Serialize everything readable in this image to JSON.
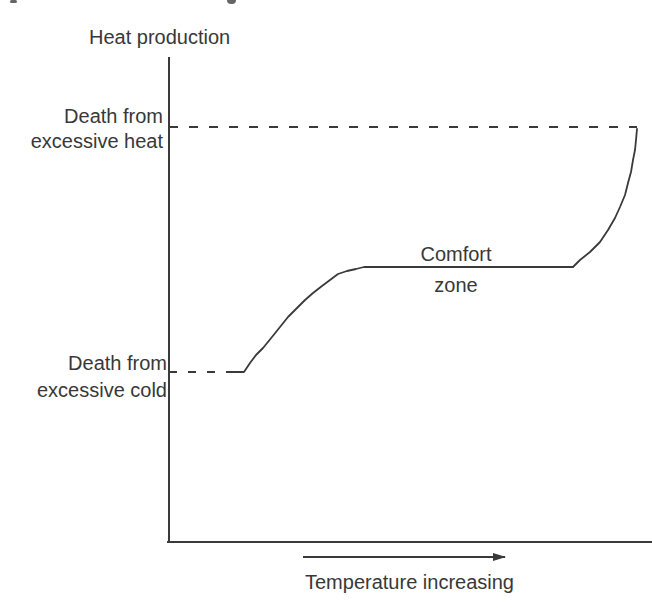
{
  "page": {
    "background": "#ffffff"
  },
  "colors": {
    "ink": "#3a3a3a",
    "text": "#383838"
  },
  "figure": {
    "y_axis_label": "Heat production",
    "x_axis_label": "Temperature increasing",
    "threshold_high_label": "Death from\nexcessive heat",
    "threshold_low_label": "Death from\nexcessive cold",
    "comfort_zone_label": "Comfort\nzone"
  },
  "chart_data": {
    "type": "line",
    "title": "",
    "xlabel": "Temperature increasing",
    "ylabel": "Heat production",
    "grid": false,
    "legend": false,
    "x_ticks": [],
    "y_ticks": [],
    "axis_note": "no numeric scales; x-axis direction shown by arrow labeled Temperature increasing",
    "annotations": [
      {
        "label": "Death from excessive heat",
        "style": "dashed horizontal threshold",
        "position": "upper, level with top of curve"
      },
      {
        "label": "Death from excessive cold",
        "style": "dashed horizontal threshold",
        "position": "lower, level with start of curve"
      },
      {
        "label": "Comfort zone",
        "style": "text centered above the flat plateau",
        "position": "middle"
      }
    ],
    "series": [
      {
        "name": "heat-production-curve",
        "shape": "starts high-slope rise from cold-death threshold, flattens into comfort-zone plateau, then steepens sharply upward to heat-death threshold",
        "points_px": [
          [
            228,
            372
          ],
          [
            244,
            372
          ],
          [
            250,
            363
          ],
          [
            256,
            355
          ],
          [
            263,
            348
          ],
          [
            272,
            337
          ],
          [
            280,
            327
          ],
          [
            288,
            317
          ],
          [
            297,
            308
          ],
          [
            305,
            300
          ],
          [
            313,
            293
          ],
          [
            322,
            286
          ],
          [
            330,
            280
          ],
          [
            338,
            274
          ],
          [
            347,
            271
          ],
          [
            356,
            269
          ],
          [
            364,
            267
          ],
          [
            573,
            267
          ],
          [
            580,
            260
          ],
          [
            590,
            252
          ],
          [
            600,
            242
          ],
          [
            608,
            230
          ],
          [
            615,
            218
          ],
          [
            620,
            207
          ],
          [
            625,
            195
          ],
          [
            628,
            183
          ],
          [
            631,
            172
          ],
          [
            633,
            160
          ],
          [
            635,
            150
          ],
          [
            636,
            140
          ],
          [
            637,
            129
          ]
        ]
      }
    ],
    "geometry": {
      "lines": [
        {
          "name": "y-axis",
          "x1": 169,
          "y1": 57,
          "x2": 169,
          "y2": 542,
          "dash": ""
        },
        {
          "name": "x-axis",
          "x1": 167,
          "y1": 542,
          "x2": 652,
          "y2": 542,
          "dash": ""
        },
        {
          "name": "heat-death-dashed-line",
          "x1": 169,
          "y1": 127,
          "x2": 637,
          "y2": 127,
          "dash": "9 11"
        },
        {
          "name": "cold-death-dashed-line",
          "x1": 169,
          "y1": 372,
          "x2": 229,
          "y2": 372,
          "dash": "8 11"
        },
        {
          "name": "temperature-arrow",
          "x1": 303,
          "y1": 557,
          "x2": 505,
          "y2": 557,
          "dash": "",
          "arrow": true
        }
      ]
    }
  }
}
